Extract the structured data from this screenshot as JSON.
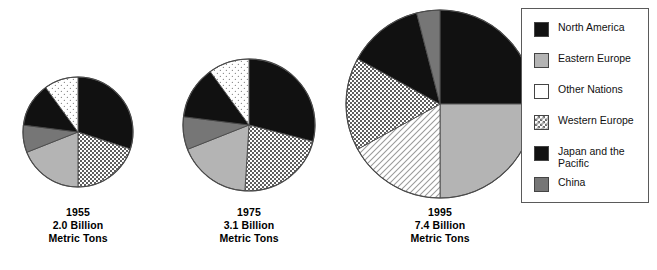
{
  "chart_data": {
    "type": "pie",
    "title": "",
    "subtitle": "",
    "xlabel": "",
    "ylabel": "",
    "legend_position": "right",
    "grid": false,
    "categories": [
      "North America",
      "Eastern Europe",
      "Other Nations",
      "Western Europe",
      "Japan and the Pacific",
      "China"
    ],
    "charts": [
      {
        "id": "pie-1955",
        "year": "1955",
        "total": "2.0 Billion",
        "unit": "Metric Tons",
        "total_value": 2.0,
        "radius_px": 55,
        "center": [
          78,
          132
        ],
        "slices": [
          {
            "label": "North America",
            "value": 30,
            "pattern": "solid-black",
            "color": "#111111"
          },
          {
            "label": "Western Europe",
            "value": 20,
            "pattern": "dotted",
            "color": "#ffffff"
          },
          {
            "label": "Eastern Europe",
            "value": 19,
            "pattern": "solid-lightgray",
            "color": "#b4b4b4"
          },
          {
            "label": "China",
            "value": 8,
            "pattern": "solid-darkgray",
            "color": "#767676"
          },
          {
            "label": "Japan and the Pacific",
            "value": 13,
            "pattern": "solid-black",
            "color": "#111111"
          },
          {
            "label": "Other Nations",
            "value": 10,
            "pattern": "sparse-dots",
            "color": "#ffffff"
          }
        ]
      },
      {
        "id": "pie-1975",
        "year": "1975",
        "total": "3.1 Billion",
        "unit": "Metric Tons",
        "total_value": 3.1,
        "radius_px": 66,
        "center": [
          249,
          125
        ],
        "slices": [
          {
            "label": "North America",
            "value": 29,
            "pattern": "solid-black",
            "color": "#111111"
          },
          {
            "label": "Western Europe",
            "value": 22,
            "pattern": "dotted",
            "color": "#ffffff"
          },
          {
            "label": "Eastern Europe",
            "value": 18,
            "pattern": "solid-lightgray",
            "color": "#b4b4b4"
          },
          {
            "label": "China",
            "value": 8,
            "pattern": "solid-darkgray",
            "color": "#767676"
          },
          {
            "label": "Japan and the Pacific",
            "value": 13,
            "pattern": "solid-black",
            "color": "#111111"
          },
          {
            "label": "Other Nations",
            "value": 10,
            "pattern": "sparse-dots",
            "color": "#ffffff"
          }
        ]
      },
      {
        "id": "pie-1995",
        "year": "1995",
        "total": "7.4 Billion",
        "unit": "Metric Tons",
        "total_value": 7.4,
        "radius_px": 94,
        "center": [
          440,
          104
        ],
        "slices": [
          {
            "label": "North America",
            "value": 25,
            "pattern": "solid-black",
            "color": "#111111"
          },
          {
            "label": "Eastern Europe",
            "value": 25,
            "pattern": "solid-lightgray",
            "color": "#b4b4b4"
          },
          {
            "label": "Other Nations",
            "value": 17,
            "pattern": "diagonal-hatch",
            "color": "#ffffff"
          },
          {
            "label": "Western Europe",
            "value": 16,
            "pattern": "dotted",
            "color": "#ffffff"
          },
          {
            "label": "Japan and the Pacific",
            "value": 13,
            "pattern": "solid-black",
            "color": "#111111"
          },
          {
            "label": "China",
            "value": 4,
            "pattern": "solid-darkgray",
            "color": "#767676"
          }
        ]
      }
    ]
  },
  "captions": [
    {
      "year": "1955",
      "amount": "2.0 Billion",
      "unit": "Metric Tons"
    },
    {
      "year": "1975",
      "amount": "3.1 Billion",
      "unit": "Metric Tons"
    },
    {
      "year": "1995",
      "amount": "7.4 Billion",
      "unit": "Metric Tons"
    }
  ],
  "legend": {
    "items": [
      {
        "label": "North America",
        "swatch": "solid-black",
        "color": "#111111"
      },
      {
        "label": "Eastern Europe",
        "swatch": "solid-lightgray",
        "color": "#b4b4b4"
      },
      {
        "label": "Other Nations",
        "swatch": "white",
        "color": "#ffffff"
      },
      {
        "label": "Western Europe",
        "swatch": "checker-dots",
        "color": "#ffffff"
      },
      {
        "label": "Japan and the Pacific",
        "swatch": "solid-black",
        "color": "#1a1a1a"
      },
      {
        "label": "China",
        "swatch": "solid-darkgray",
        "color": "#767676"
      }
    ]
  },
  "colors": {
    "black": "#111111",
    "dark_gray": "#767676",
    "light_gray": "#b4b4b4",
    "white": "#ffffff",
    "outline": "#555555",
    "legend_border": "#5a5a5a"
  }
}
